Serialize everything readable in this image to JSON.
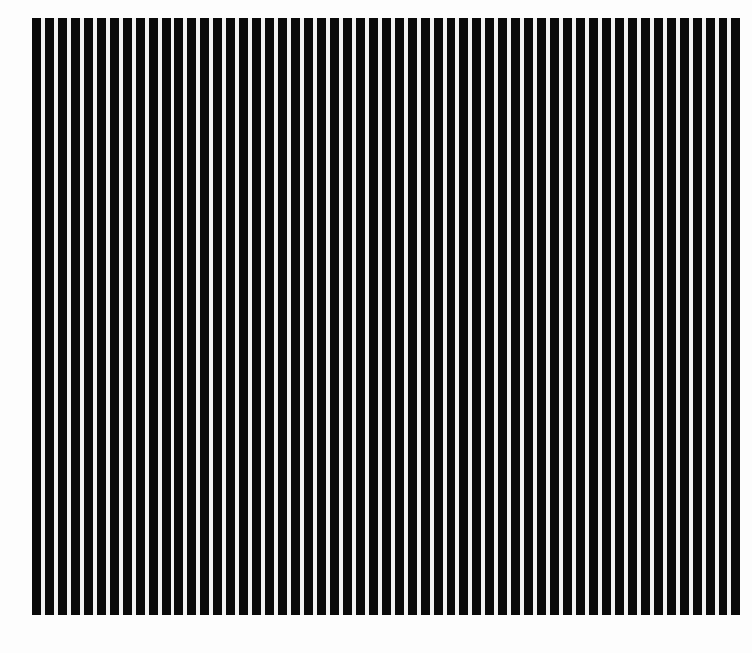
{
  "figure": {
    "background_color": "#fdfdfd",
    "bar_color": "#0a0a0a",
    "gap_color": "#f2f2f2",
    "region": {
      "left": 32,
      "top": 18,
      "width": 713,
      "height": 597
    },
    "bar_width": 9,
    "gap_width": 4,
    "bar_count": 55
  }
}
